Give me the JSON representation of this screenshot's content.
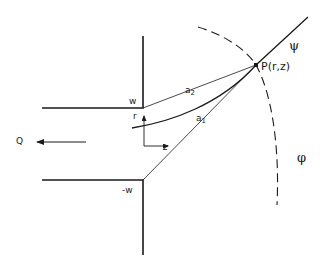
{
  "diagram": {
    "type": "geometry-schematic",
    "labels": {
      "wall_top": "w",
      "wall_bottom": "-w",
      "flow": "Q",
      "axis_r": "r",
      "axis_z": "z",
      "dist_a2_base": "a",
      "dist_a2_sub": "2",
      "dist_a1_base": "a",
      "dist_a1_sub": "1",
      "point": "P(r,z)",
      "streamline": "ψ",
      "equipotential": "φ"
    },
    "elements": [
      {
        "id": "upper-wall",
        "kind": "solid-polyline",
        "points": [
          [
            42,
            108
          ],
          [
            143,
            108
          ],
          [
            143,
            36
          ]
        ]
      },
      {
        "id": "lower-wall",
        "kind": "solid-polyline",
        "points": [
          [
            42,
            180
          ],
          [
            143,
            180
          ],
          [
            143,
            255
          ]
        ]
      },
      {
        "id": "line-a2",
        "kind": "thin-line",
        "from": [
          143,
          108
        ],
        "to": [
          256,
          65
        ]
      },
      {
        "id": "line-a1",
        "kind": "thin-line",
        "from": [
          143,
          180
        ],
        "to": [
          256,
          65
        ]
      },
      {
        "id": "streamline-psi",
        "kind": "curve",
        "through": [
          [
            132,
            128
          ],
          [
            256,
            65
          ],
          [
            308,
            17
          ]
        ]
      },
      {
        "id": "equipotential-phi",
        "kind": "dashed-arc",
        "through": [
          [
            198,
            27
          ],
          [
            256,
            65
          ],
          [
            277,
            205
          ]
        ]
      },
      {
        "id": "flow-arrow-Q",
        "kind": "arrow",
        "from": [
          86,
          142
        ],
        "to": [
          36,
          142
        ]
      },
      {
        "id": "axis-r",
        "kind": "arrow",
        "from": [
          144,
          146
        ],
        "to": [
          144,
          116
        ]
      },
      {
        "id": "axis-z",
        "kind": "arrow",
        "from": [
          144,
          146
        ],
        "to": [
          167,
          146
        ]
      },
      {
        "id": "point-P",
        "kind": "dot",
        "at": [
          256,
          65
        ]
      }
    ],
    "colors": {
      "ink": "#1a1a1a",
      "background": "#ffffff"
    }
  }
}
